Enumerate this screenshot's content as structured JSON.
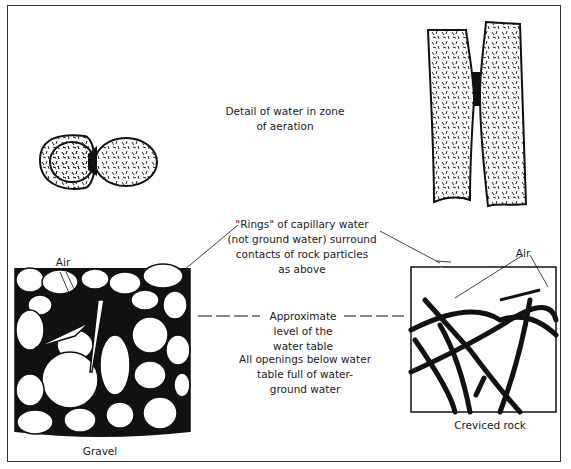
{
  "diagram": {
    "labels": {
      "detail": "Detail of water in zone\nof aeration",
      "rings": "\"Rings\" of capillary water\n(not ground water) surround\ncontacts of rock particles\nas above",
      "water_table": "Approximate\nlevel of the water table",
      "openings": "All openings below water\ntable full of water-\nground water",
      "air_left": "Air",
      "air_right": "Air",
      "gravel": "Gravel",
      "creviced_rock": "Creviced rock"
    },
    "panels": [
      {
        "name": "two-grains-detail",
        "caption": ""
      },
      {
        "name": "crevice-detail",
        "caption": ""
      },
      {
        "name": "gravel-block",
        "caption": "Gravel"
      },
      {
        "name": "creviced-rock-block",
        "caption": "Creviced rock"
      }
    ],
    "colors": {
      "ink": "#1a1a1a",
      "water": "#111111",
      "background": "#ffffff"
    }
  }
}
